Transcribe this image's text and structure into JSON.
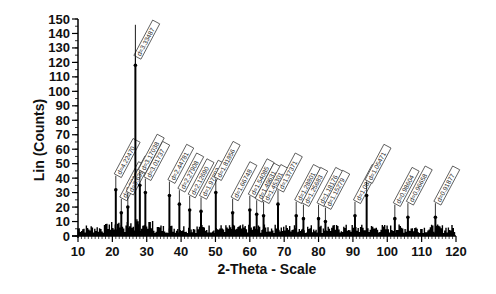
{
  "chart_data": {
    "type": "line",
    "title": "",
    "xlabel": "2-Theta - Scale",
    "ylabel": "Lin (Counts)",
    "xlim": [
      10,
      120
    ],
    "ylim": [
      0,
      150
    ],
    "x_ticks": [
      10,
      20,
      30,
      40,
      50,
      60,
      70,
      80,
      90,
      100,
      110,
      120
    ],
    "y_ticks": [
      0,
      10,
      20,
      30,
      40,
      50,
      60,
      70,
      80,
      90,
      100,
      110,
      120,
      130,
      140,
      150
    ],
    "grid": false,
    "legend": null,
    "background_noise_level": 5,
    "peaks": [
      {
        "two_theta": 21.0,
        "counts": 32,
        "label": "d=4.22470"
      },
      {
        "two_theta": 22.6,
        "counts": 16,
        "label": "d=3.93083"
      },
      {
        "two_theta": 24.5,
        "counts": 20,
        "label": "d=3.63931"
      },
      {
        "two_theta": 26.7,
        "counts": 118,
        "label": "d=3.33487"
      },
      {
        "two_theta": 28.0,
        "counts": 35,
        "label": "d=3.17038"
      },
      {
        "two_theta": 29.6,
        "counts": 30,
        "label": "d=3.01737"
      },
      {
        "two_theta": 36.6,
        "counts": 28,
        "label": "d=2.44781"
      },
      {
        "two_theta": 39.5,
        "counts": 22,
        "label": "d=2.27908"
      },
      {
        "two_theta": 42.5,
        "counts": 18,
        "label": "d=2.12690"
      },
      {
        "two_theta": 45.8,
        "counts": 17,
        "label": "d=1.97892"
      },
      {
        "two_theta": 50.1,
        "counts": 30,
        "label": "d=1.81856"
      },
      {
        "two_theta": 55.0,
        "counts": 16,
        "label": "d=1.66748"
      },
      {
        "two_theta": 60.0,
        "counts": 18,
        "label": "d=1.54085"
      },
      {
        "two_theta": 62.0,
        "counts": 15,
        "label": "d=1.49631"
      },
      {
        "two_theta": 64.0,
        "counts": 14,
        "label": "d=1.45301"
      },
      {
        "two_theta": 68.2,
        "counts": 22,
        "label": "d=1.37371"
      },
      {
        "two_theta": 73.5,
        "counts": 14,
        "label": "d=1.28801"
      },
      {
        "two_theta": 75.6,
        "counts": 12,
        "label": "d=1.25683"
      },
      {
        "two_theta": 80.0,
        "counts": 12,
        "label": "d=1.18176"
      },
      {
        "two_theta": 82.0,
        "counts": 10,
        "label": "d=1.15279"
      },
      {
        "two_theta": 90.6,
        "counts": 14,
        "label": "d=1.08333"
      },
      {
        "two_theta": 94.0,
        "counts": 28,
        "label": "d=1.05471"
      },
      {
        "two_theta": 102.2,
        "counts": 12,
        "label": "d=0.98604"
      },
      {
        "two_theta": 106.0,
        "counts": 13,
        "label": "d=0.96658"
      },
      {
        "two_theta": 114.0,
        "counts": 13,
        "label": "d=0.91877"
      }
    ]
  },
  "style": {
    "line_color": "#000000",
    "background": "#ffffff",
    "label_box_border": "#333333"
  }
}
